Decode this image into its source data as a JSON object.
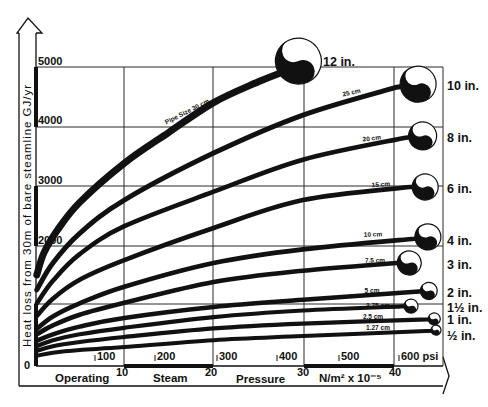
{
  "chart_data": {
    "type": "line",
    "title": "",
    "ylabel": "Heat loss from 30m of bare steamline GJ/yr",
    "xlabel": "Operating Steam Pressure N/m² x 10⁻⁵",
    "xlabel_words": [
      "Operating",
      "Steam",
      "Pressure",
      "N/m² x 10⁻⁵"
    ],
    "xlim": [
      0,
      45
    ],
    "ylim": [
      0,
      5000
    ],
    "grid": true,
    "legend": "inline labels at curve ends (pipe size in inches) and along curves (cm)",
    "y_origin_label": "0",
    "yticks": [
      {
        "value": 2000,
        "label": "2000"
      },
      {
        "value": 3000,
        "label": "3000"
      },
      {
        "value": 4000,
        "label": "4000"
      },
      {
        "value": 5000,
        "label": "5000"
      }
    ],
    "xticks": [
      {
        "value": 10,
        "label": "10"
      },
      {
        "value": 20,
        "label": "20"
      },
      {
        "value": 30,
        "label": "30"
      },
      {
        "value": 40,
        "label": "40"
      }
    ],
    "psi_ticks": [
      {
        "value": 100,
        "label": "100"
      },
      {
        "value": 200,
        "label": "200"
      },
      {
        "value": 300,
        "label": "300"
      },
      {
        "value": 400,
        "label": "400"
      },
      {
        "value": 500,
        "label": "500"
      },
      {
        "value": 600,
        "label": "600 psi"
      }
    ],
    "series": [
      {
        "name": "12 in.",
        "metric_label": "Pipe Size 30 cm",
        "x": [
          0.2,
          1,
          2.5,
          5,
          10,
          15,
          20,
          25,
          27.5
        ],
        "y": [
          1500,
          1870,
          2250,
          2720,
          3380,
          3900,
          4400,
          4750,
          4900
        ],
        "marker": [
          29.5,
          5100
        ]
      },
      {
        "name": "10 in.",
        "metric_label": "25 cm",
        "x": [
          0.2,
          2,
          5,
          10,
          20,
          30,
          40.5
        ],
        "y": [
          1250,
          1700,
          2200,
          2760,
          3550,
          4190,
          4660
        ],
        "marker": [
          42.9,
          4710
        ]
      },
      {
        "name": "8 in.",
        "metric_label": "20 cm",
        "x": [
          0.2,
          2,
          5,
          10,
          20,
          30,
          41.5
        ],
        "y": [
          1020,
          1400,
          1850,
          2320,
          2900,
          3440,
          3810
        ],
        "marker": [
          43.4,
          3840
        ]
      },
      {
        "name": "6 in.",
        "metric_label": "15 cm",
        "x": [
          0.2,
          2,
          5,
          10,
          20,
          30,
          42
        ],
        "y": [
          810,
          1100,
          1420,
          1750,
          2290,
          2760,
          2980
        ],
        "marker": [
          43.7,
          2980
        ]
      },
      {
        "name": "4 in.",
        "metric_label": "10 cm",
        "x": [
          0.2,
          2,
          5,
          10,
          20,
          30,
          42.5
        ],
        "y": [
          590,
          800,
          1020,
          1300,
          1700,
          1930,
          2110
        ],
        "marker": [
          44.0,
          2140
        ]
      },
      {
        "name": "3 in.",
        "metric_label": "7.5 cm",
        "x": [
          0.2,
          2,
          5,
          10,
          20,
          30,
          40.5
        ],
        "y": [
          500,
          650,
          830,
          1030,
          1380,
          1570,
          1700
        ],
        "marker": [
          41.9,
          1700
        ]
      },
      {
        "name": "2 in.",
        "metric_label": "5 cm",
        "x": [
          0.2,
          2,
          5,
          10,
          20,
          30,
          43
        ],
        "y": [
          390,
          500,
          630,
          775,
          960,
          1080,
          1220
        ],
        "marker": [
          44.1,
          1230
        ]
      },
      {
        "name": "1½ in.",
        "metric_label": "3.75 cm",
        "x": [
          0.2,
          2,
          5,
          10,
          20,
          30,
          41
        ],
        "y": [
          300,
          400,
          500,
          610,
          790,
          900,
          970
        ],
        "marker": [
          42.1,
          975
        ]
      },
      {
        "name": "1 in.",
        "metric_label": "2.5 cm",
        "x": [
          0.2,
          2,
          5,
          10,
          20,
          30,
          44
        ],
        "y": [
          220,
          300,
          370,
          455,
          600,
          680,
          750
        ],
        "marker": [
          44.7,
          760
        ]
      },
      {
        "name": "½ in.",
        "metric_label": "1.27 cm",
        "x": [
          0.2,
          2,
          5,
          10,
          20,
          30,
          44.5
        ],
        "y": [
          140,
          190,
          235,
          285,
          400,
          470,
          560
        ],
        "marker": [
          44.9,
          570
        ]
      }
    ]
  }
}
